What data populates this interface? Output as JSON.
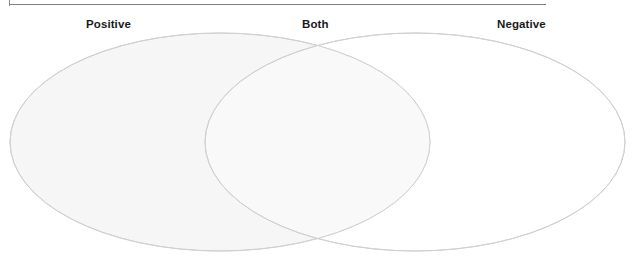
{
  "figure": {
    "name": "venn-diagram",
    "type": "two-set-venn",
    "width": 644,
    "height": 256,
    "background_color": "#ffffff",
    "frame": {
      "visible": true,
      "color": "#808080"
    }
  },
  "labels": {
    "left": "Positive",
    "overlap": "Both",
    "right": "Negative"
  },
  "sets": [
    {
      "id": "left-set",
      "label": "Positive",
      "fill_color": "#f6f6f6",
      "stroke_color": "#d0d0d0",
      "cx": 220,
      "cy": 142,
      "rx": 210,
      "ry": 109
    },
    {
      "id": "right-set",
      "label": "Negative",
      "fill_color": "#ffffff",
      "stroke_color": "#d0d0d0",
      "cx": 415,
      "cy": 142,
      "rx": 210,
      "ry": 109
    }
  ],
  "overlap": {
    "id": "overlap-region",
    "label": "Both",
    "fill_color": "#f9f9f9"
  }
}
